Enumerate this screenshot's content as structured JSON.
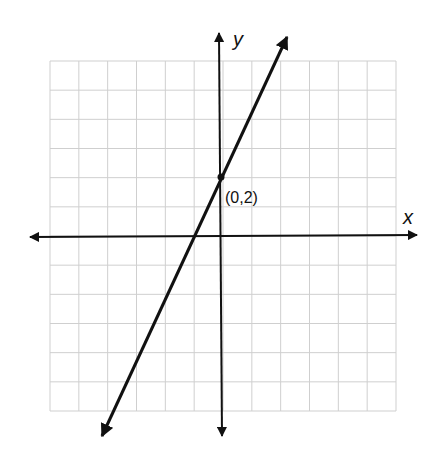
{
  "chart_data": {
    "type": "line",
    "title": "",
    "xlabel": "x",
    "ylabel": "y",
    "xlim": [
      -6,
      6
    ],
    "ylim": [
      -6,
      6
    ],
    "grid": true,
    "grid_step": 1,
    "tick_labels": false,
    "series": [
      {
        "name": "y = 2x + 2",
        "slope": 2,
        "intercept": 2,
        "x": [
          -4.2,
          -1,
          0,
          2.35
        ],
        "y": [
          -6.4,
          0,
          2,
          6.7
        ],
        "arrows_both_ends": true
      }
    ],
    "annotations": [
      {
        "type": "point",
        "x": 0,
        "y": 2,
        "label": "(0,2)"
      }
    ]
  },
  "labels": {
    "x_axis": "x",
    "y_axis": "y",
    "point": "(0,2)"
  },
  "colors": {
    "grid": "#cfcfcf",
    "axis": "#111111",
    "line": "#111111",
    "background": "#ffffff"
  }
}
